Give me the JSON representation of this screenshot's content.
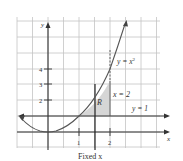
{
  "diagram": {
    "title": "",
    "axes": {
      "x_label": "x",
      "y_label": "y",
      "x_ticks": [
        "1",
        "2"
      ],
      "y_ticks": [
        "2",
        "3",
        "4"
      ]
    },
    "curves": [
      {
        "name": "parabola",
        "label": "y = x²",
        "label_base": "y = x",
        "label_sup": "2"
      },
      {
        "name": "horizontal-line",
        "label": "y = 1"
      },
      {
        "name": "vertical-line",
        "label": "x = 2"
      }
    ],
    "region_label": "R",
    "fixed_label": "Fixed x",
    "colors": {
      "grid": "#bdbdbd",
      "axes": "#333333",
      "curve": "#555555",
      "shade": "#d9d9d9"
    }
  }
}
